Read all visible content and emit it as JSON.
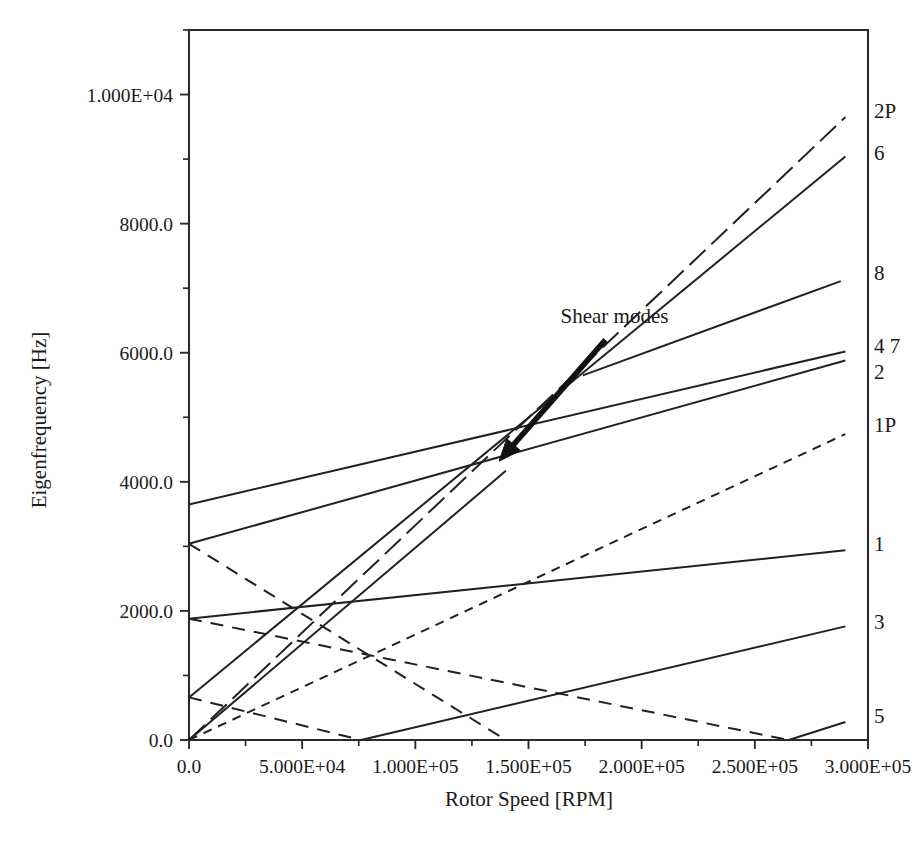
{
  "figure": {
    "kind": "campbell-diagram",
    "background": "#ffffff",
    "ink": "#212121"
  },
  "chart_data": {
    "type": "line",
    "title": "",
    "subtitle": "",
    "xlabel": "Rotor Speed [RPM]",
    "ylabel": "Eigenfrequency [Hz]",
    "xlim": [
      0,
      300000
    ],
    "ylim": [
      0,
      11000
    ],
    "grid": false,
    "legend_position": "right-inline-labels",
    "xticks": [
      0,
      50000,
      100000,
      150000,
      200000,
      250000,
      300000
    ],
    "xtick_labels": [
      "0.0",
      "5.000E+04",
      "1.000E+05",
      "1.500E+05",
      "2.000E+05",
      "2.500E+05",
      "3.000E+05"
    ],
    "x_minor_ticks": [
      25000,
      75000,
      125000,
      175000,
      225000,
      275000
    ],
    "yticks": [
      0,
      2000,
      4000,
      6000,
      8000,
      10000
    ],
    "ytick_labels": [
      "0.0",
      "2000.0",
      "4000.0",
      "6000.0",
      "8000.0",
      "1.000E+04"
    ],
    "y_minor_ticks": [
      1000,
      3000,
      5000,
      7000,
      9000,
      11000
    ],
    "series": [
      {
        "name": "2P",
        "label": "2P",
        "style": "longdash",
        "label_x": 300000,
        "label_y": 9750,
        "x": [
          0,
          290000
        ],
        "y": [
          0,
          9650
        ]
      },
      {
        "name": "6",
        "label": "6",
        "style": "solid",
        "label_x": 300000,
        "label_y": 9100,
        "x": [
          0,
          290000
        ],
        "y": [
          660,
          9040
        ]
      },
      {
        "name": "8",
        "label": "8",
        "style": "solid",
        "label_x": 300000,
        "label_y": 7240,
        "x": [
          174000,
          288000
        ],
        "y": [
          5650,
          7110
        ]
      },
      {
        "name": "4",
        "label": "4 7",
        "style": "solid",
        "label_x": 300000,
        "label_y": 6100,
        "x": [
          0,
          290000
        ],
        "y": [
          3650,
          6020
        ]
      },
      {
        "name": "2",
        "label": "2",
        "style": "solid",
        "label_x": 300000,
        "label_y": 5700,
        "x": [
          0,
          290000
        ],
        "y": [
          3040,
          5880
        ]
      },
      {
        "name": "1P",
        "label": "1P",
        "style": "dotted",
        "label_x": 300000,
        "label_y": 4880,
        "x": [
          0,
          290000
        ],
        "y": [
          0,
          4740
        ]
      },
      {
        "name": "1",
        "label": "1",
        "style": "solid",
        "label_x": 300000,
        "label_y": 3030,
        "x": [
          0,
          290000
        ],
        "y": [
          1880,
          2940
        ]
      },
      {
        "name": "3",
        "label": "3",
        "style": "solid",
        "label_x": 300000,
        "label_y": 1830,
        "x": [
          76000,
          290000
        ],
        "y": [
          0,
          1760
        ]
      },
      {
        "name": "5",
        "label": "5",
        "style": "solid",
        "label_x": 300000,
        "label_y": 370,
        "x": [
          265000,
          290000
        ],
        "y": [
          0,
          280
        ]
      },
      {
        "name": "backward-whirl-a",
        "label": "",
        "style": "dashed",
        "x": [
          0,
          140000
        ],
        "y": [
          3040,
          0
        ]
      },
      {
        "name": "backward-whirl-b",
        "label": "",
        "style": "dashed",
        "x": [
          0,
          265000
        ],
        "y": [
          1880,
          0
        ]
      },
      {
        "name": "backward-whirl-c",
        "label": "",
        "style": "dashed",
        "x": [
          0,
          76000
        ],
        "y": [
          660,
          0
        ]
      },
      {
        "name": "forward-steep",
        "label": "",
        "style": "solid",
        "x": [
          0,
          140000
        ],
        "y": [
          0,
          4170
        ]
      }
    ],
    "annotations": [
      {
        "name": "shear-modes",
        "text": "Shear modes",
        "text_x": 188000,
        "text_y": 6460,
        "arrow_from_x": 184000,
        "arrow_from_y": 6200,
        "arrow_to_x": 137000,
        "arrow_to_y": 4320
      }
    ]
  }
}
